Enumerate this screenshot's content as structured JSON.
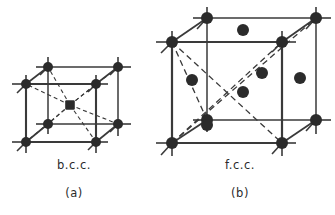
{
  "figure": {
    "background": "#ffffff",
    "stroke_color": "#3a3a3a",
    "atom_color": "#2b2b2b",
    "panels": [
      {
        "id": "bcc",
        "structure_label": "b.c.c.",
        "panel_label": "(a)",
        "description": "body-centred cubic unit cell",
        "atom_count": 9,
        "corner_atoms": 8,
        "interior_atoms": 1,
        "atom_radius": 5.0,
        "cube": {
          "front": {
            "left": 26,
            "right": 96,
            "top": 84,
            "bottom": 142
          },
          "back": {
            "left": 48,
            "right": 118,
            "top": 67,
            "bottom": 124
          }
        },
        "diagonals": "dashed body diagonals from centre atom to all eight corners",
        "center_atom": {
          "x": 70,
          "y": 105
        }
      },
      {
        "id": "fcc",
        "structure_label": "f.c.c.",
        "panel_label": "(b)",
        "description": "face-centred cubic unit cell",
        "atom_count": 14,
        "corner_atoms": 8,
        "face_atoms": 6,
        "atom_radius": 6.0,
        "cube": {
          "front": {
            "left": 172,
            "right": 282,
            "top": 42,
            "bottom": 143
          },
          "back": {
            "left": 207,
            "right": 316,
            "top": 18,
            "bottom": 120
          }
        },
        "diagonals": "dashed face diagonals crossing at the front/side face centres",
        "face_atoms_positions": [
          {
            "x": 243,
            "y": 92,
            "face": "front-face-centre"
          },
          {
            "x": 207,
            "y": 125,
            "face": "bottom-face-centre-front"
          },
          {
            "x": 262,
            "y": 73,
            "face": "right-face-centre"
          },
          {
            "x": 192,
            "y": 80,
            "face": "left-face-centre"
          },
          {
            "x": 300,
            "y": 78,
            "face": "back-face-centre"
          },
          {
            "x": 243,
            "y": 30,
            "face": "top-face-centre"
          }
        ]
      }
    ]
  }
}
